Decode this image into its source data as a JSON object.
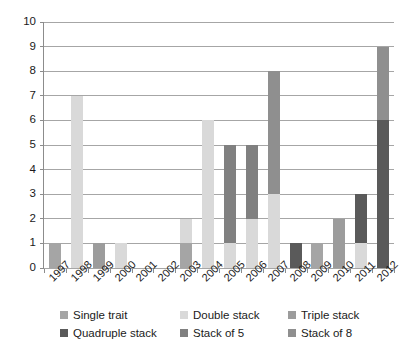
{
  "chart_data": {
    "type": "bar",
    "subtype": "stacked-vertical",
    "title": "",
    "subtitle": "",
    "xlabel": "",
    "ylabel": "",
    "ylim": [
      0,
      10
    ],
    "ytick_step": 1,
    "grid": true,
    "legend_position": "bottom",
    "categories": [
      "1997",
      "1998",
      "1999",
      "2000",
      "2001",
      "2002",
      "2003",
      "2004",
      "2005",
      "2006",
      "2007",
      "2008",
      "2009",
      "2010",
      "2011",
      "2012"
    ],
    "yticks": [
      "0",
      "1",
      "2",
      "3",
      "4",
      "5",
      "6",
      "7",
      "8",
      "9",
      "10"
    ],
    "series": [
      {
        "name": "Single trait",
        "color": "#a5a5a5",
        "values": [
          1,
          0,
          0,
          0,
          0,
          0,
          1,
          0,
          0,
          0,
          0,
          0,
          1,
          0,
          0,
          0
        ]
      },
      {
        "name": "Double stack",
        "color": "#d9d9d9",
        "values": [
          0,
          7,
          0,
          1,
          0,
          0,
          1,
          6,
          1,
          2,
          3,
          0,
          0,
          0,
          1,
          0
        ]
      },
      {
        "name": "Triple stack",
        "color": "#9c9c9c",
        "values": [
          0,
          0,
          1,
          0,
          0,
          0,
          0,
          0,
          0,
          0,
          0,
          0,
          0,
          2,
          0,
          0
        ]
      },
      {
        "name": "Quadruple stack",
        "color": "#5a5a5a",
        "values": [
          0,
          0,
          0,
          0,
          0,
          0,
          0,
          0,
          0,
          0,
          0,
          1,
          0,
          0,
          2,
          6
        ]
      },
      {
        "name": "Stack of 5",
        "color": "#808080",
        "values": [
          0,
          0,
          0,
          0,
          0,
          0,
          0,
          0,
          4,
          3,
          0,
          0,
          0,
          0,
          0,
          0
        ]
      },
      {
        "name": "Stack of 8",
        "color": "#8f8f8f",
        "values": [
          0,
          0,
          0,
          0,
          0,
          0,
          0,
          0,
          0,
          0,
          5,
          0,
          0,
          0,
          0,
          3
        ]
      }
    ],
    "totals": [
      1,
      7,
      1,
      1,
      0,
      0,
      2,
      6,
      5,
      5,
      8,
      1,
      1,
      2,
      3,
      9
    ],
    "stack_order": [
      "Single trait",
      "Double stack",
      "Triple stack",
      "Quadruple stack",
      "Stack of 5",
      "Stack of 8"
    ],
    "colors": {
      "grid": "#a6a6a6",
      "axis": "#8c8c8c",
      "text": "#1a1a1a",
      "background": "#ffffff"
    }
  },
  "legend": {
    "rows": [
      [
        {
          "label": "Single trait",
          "color": "#a5a5a5"
        },
        {
          "label": "Double stack",
          "color": "#d9d9d9"
        },
        {
          "label": "Triple stack",
          "color": "#9c9c9c"
        }
      ],
      [
        {
          "label": "Quadruple stack",
          "color": "#5a5a5a"
        },
        {
          "label": "Stack of 5",
          "color": "#808080"
        },
        {
          "label": "Stack of 8",
          "color": "#8f8f8f"
        }
      ]
    ]
  }
}
